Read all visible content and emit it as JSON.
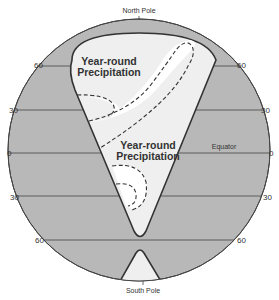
{
  "diagram": {
    "title": "",
    "poles": {
      "north": "North Pole",
      "south": "South Pole"
    },
    "equator_label": "Equator",
    "latitude_labels": {
      "n60_left": "60",
      "n60_right": "60",
      "n30_left": "30",
      "n30_right": "30",
      "eq_left": "0",
      "eq_right": "0",
      "s30_left": "30",
      "s30_right": "30",
      "s60_left": "60",
      "s60_right": "60"
    },
    "zones": [
      {
        "line1": "Year-round",
        "line2": "Precipitation"
      },
      {
        "line1": "Year-round",
        "line2": "Precipitation"
      }
    ],
    "colors": {
      "globe_fill": "#b8b8b8",
      "wedge_fill": "#efefef",
      "clear_area": "#ffffff",
      "outline": "#333333",
      "text": "#333333"
    }
  }
}
